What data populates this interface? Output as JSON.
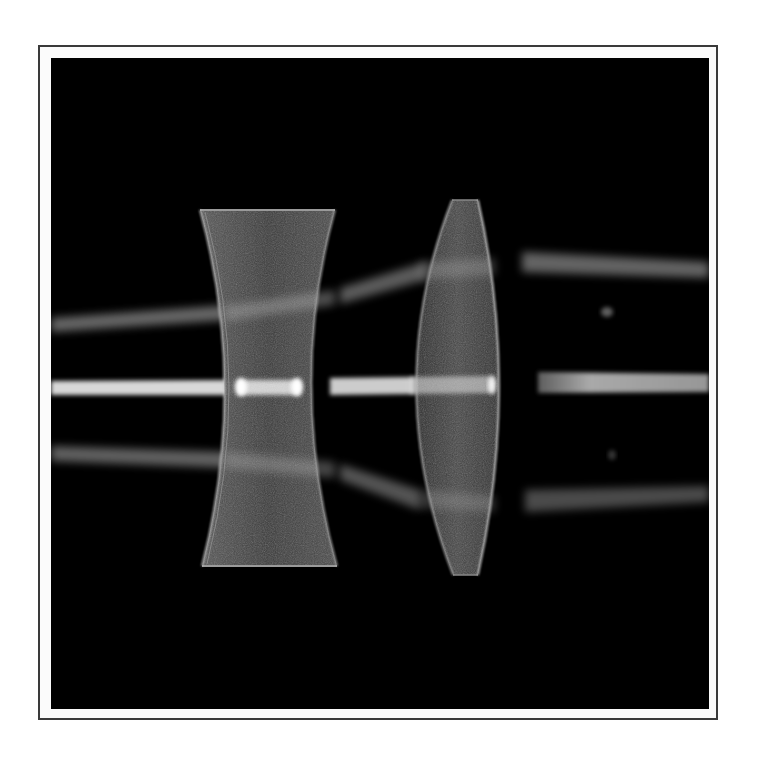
{
  "figure": {
    "background_color": "#000000",
    "frame_color": "#3a3a3a",
    "concave_lens": {
      "label": "diverging-lens",
      "top": {
        "x1": 200,
        "x2": 335,
        "y": 210
      },
      "bottom": {
        "x1": 202,
        "x2": 337,
        "y": 566
      },
      "waist": {
        "x1": 236,
        "x2": 297,
        "y": 385
      }
    },
    "convex_lens": {
      "label": "converging-lens",
      "top": {
        "x1": 452,
        "x2": 478,
        "y": 200
      },
      "bottom": {
        "x1": 453,
        "x2": 478,
        "y": 575
      },
      "widest": {
        "x1": 407,
        "x2": 494,
        "y": 385
      }
    },
    "beams": [
      {
        "name": "upper-ray",
        "segments": [
          [
            50,
            325,
            225,
            313
          ],
          [
            340,
            295,
            420,
            275
          ],
          [
            520,
            262,
            709,
            270
          ]
        ]
      },
      {
        "name": "axis-ray",
        "segments": [
          [
            50,
            388,
            709,
            383
          ]
        ]
      },
      {
        "name": "lower-ray",
        "segments": [
          [
            50,
            453,
            225,
            460
          ],
          [
            340,
            470,
            420,
            500
          ],
          [
            520,
            497,
            709,
            495
          ]
        ]
      }
    ],
    "beam_color": "#e8e8e8",
    "lens_glass_color": "#4a4a4a"
  }
}
